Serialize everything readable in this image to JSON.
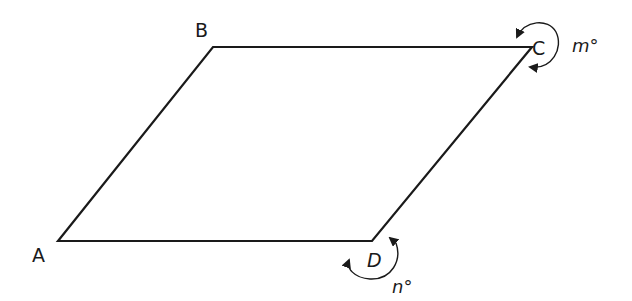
{
  "diagram": {
    "shape": "parallelogram",
    "vertices": [
      {
        "id": "A",
        "label": "A",
        "x": 58,
        "y": 241
      },
      {
        "id": "B",
        "label": "B",
        "x": 213,
        "y": 47
      },
      {
        "id": "C",
        "label": "C",
        "x": 532,
        "y": 47
      },
      {
        "id": "D",
        "label": "D",
        "x": 372,
        "y": 241
      }
    ],
    "angles": [
      {
        "vertex": "C",
        "label": "m°",
        "type": "reflex"
      },
      {
        "vertex": "D",
        "label": "n°",
        "type": "reflex"
      }
    ],
    "colors": {
      "stroke": "#1a1a1a",
      "background": "#ffffff"
    }
  },
  "labels": {
    "A": "A",
    "B": "B",
    "C": "C",
    "D": "D",
    "m": "m°",
    "n": "n°"
  }
}
